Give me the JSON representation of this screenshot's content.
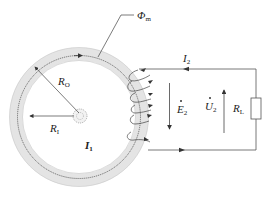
{
  "diagram": {
    "type": "toroidal current transformer schematic",
    "labels": {
      "flux": {
        "main": "Φ",
        "sub": "m"
      },
      "secondary_current": {
        "main": "I",
        "sub": "2"
      },
      "outer_radius": {
        "main": "R",
        "sub": "O"
      },
      "inner_radius": {
        "main": "R",
        "sub": "I"
      },
      "primary_current": {
        "main": "I",
        "sub": "1"
      },
      "emf": {
        "main": "E",
        "sub": "2"
      },
      "voltage": {
        "main": "U",
        "sub": "2"
      },
      "load": {
        "main": "R",
        "sub": "L"
      }
    },
    "colors": {
      "core_fill": "#e6e6e6",
      "line": "#444444",
      "background": "#ffffff"
    }
  }
}
